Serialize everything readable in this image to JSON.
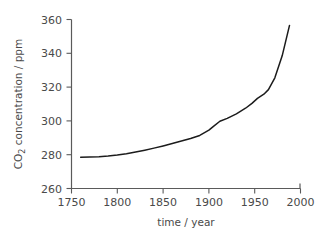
{
  "chart_data": {
    "type": "line",
    "title": "",
    "subtitle": "",
    "xlabel": "time / year",
    "ylabel_prefix": "CO",
    "ylabel_sub": "2",
    "ylabel_suffix": " concentration / ppm",
    "ylabel": "CO2 concentration / ppm",
    "xlim": [
      1750,
      2000
    ],
    "ylim": [
      260,
      360
    ],
    "xticks": [
      1750,
      1800,
      1850,
      1900,
      1950,
      2000
    ],
    "xticklabels": [
      "1750",
      "1800",
      "1850",
      "1900",
      "1950",
      "2000"
    ],
    "yticks": [
      260,
      280,
      300,
      320,
      340,
      360
    ],
    "yticklabels": [
      "260",
      "280",
      "300",
      "320",
      "340",
      "360"
    ],
    "grid": false,
    "legend": false,
    "legend_position": "none",
    "line_color": "#1c1c1c",
    "axis_color": "#5a5a5a",
    "background_color": "#ffffff",
    "series": [
      {
        "name": "CO2 concentration",
        "x": [
          1760,
          1770,
          1780,
          1790,
          1800,
          1810,
          1820,
          1830,
          1840,
          1850,
          1860,
          1870,
          1880,
          1890,
          1900,
          1905,
          1912,
          1920,
          1930,
          1940,
          1947,
          1953,
          1960,
          1965,
          1972,
          1980,
          1988
        ],
        "values": [
          278.5,
          278.6,
          278.8,
          279.2,
          279.8,
          280.6,
          281.6,
          282.7,
          283.9,
          285.2,
          286.6,
          288.1,
          289.6,
          291.4,
          294.5,
          296.8,
          299.8,
          301.5,
          304.2,
          307.5,
          310.4,
          313.3,
          315.8,
          318.5,
          325.5,
          338.5,
          356.5
        ]
      }
    ]
  }
}
